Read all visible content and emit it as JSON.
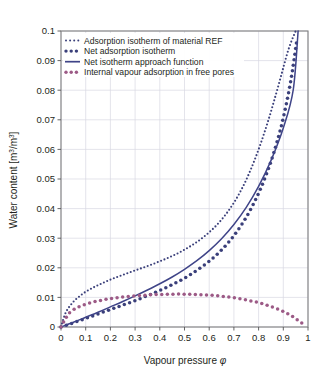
{
  "figure": {
    "background": "#ffffff",
    "frame_color": "#808080",
    "grid_color": "#d9d9e2"
  },
  "chart_data": {
    "type": "line",
    "title": "",
    "xlabel": "Vapour pressure φ",
    "ylabel": "Water content [m³/m³]",
    "ylabel_parts": {
      "pre": "Water content [m",
      "sup1": "3",
      "mid": "/m",
      "sup2": "3",
      "post": "]"
    },
    "xlim": [
      0,
      1
    ],
    "ylim": [
      0,
      0.1
    ],
    "xticks": [
      0,
      0.1,
      0.2,
      0.3,
      0.4,
      0.5,
      0.6,
      0.7,
      0.8,
      0.9,
      1
    ],
    "xtick_labels": [
      "0",
      "0.1",
      "0.2",
      "0.3",
      "0.4",
      "0.5",
      "0.6",
      "0.7",
      "0.8",
      "0.9",
      "1"
    ],
    "yticks": [
      0,
      0.01,
      0.02,
      0.03,
      0.04,
      0.05,
      0.06,
      0.07,
      0.08,
      0.09,
      0.1
    ],
    "ytick_labels": [
      "0",
      "0.01",
      "0.02",
      "0.03",
      "0.04",
      "0.05",
      "0.06",
      "0.07",
      "0.08",
      "0.09",
      "0.1"
    ],
    "grid": true,
    "legend_position": "top-left",
    "series": [
      {
        "name": "Adsorption isotherm of material REF",
        "style": "dotted",
        "marker": "small-dot",
        "color": "#3a3f7a",
        "x": [
          0.0,
          0.02,
          0.05,
          0.08,
          0.1,
          0.13,
          0.16,
          0.2,
          0.24,
          0.28,
          0.32,
          0.36,
          0.4,
          0.44,
          0.48,
          0.52,
          0.56,
          0.6,
          0.64,
          0.68,
          0.72,
          0.76,
          0.8,
          0.84,
          0.88,
          0.92,
          0.95
        ],
        "y": [
          0.0,
          0.005,
          0.0085,
          0.0107,
          0.0119,
          0.0133,
          0.0145,
          0.016,
          0.0173,
          0.0185,
          0.0197,
          0.0209,
          0.0222,
          0.0236,
          0.0252,
          0.0271,
          0.0293,
          0.032,
          0.0353,
          0.0395,
          0.0448,
          0.0516,
          0.06,
          0.07,
          0.0815,
          0.0935,
          0.1
        ]
      },
      {
        "name": "Net adsorption isotherm",
        "style": "dotted",
        "marker": "large-dot",
        "color": "#3a3f7a",
        "x": [
          0.0,
          0.03,
          0.06,
          0.09,
          0.12,
          0.15,
          0.18,
          0.21,
          0.24,
          0.27,
          0.3,
          0.33,
          0.36,
          0.39,
          0.42,
          0.45,
          0.48,
          0.51,
          0.54,
          0.57,
          0.6,
          0.63,
          0.66,
          0.69,
          0.72,
          0.75,
          0.78,
          0.81,
          0.84,
          0.87,
          0.9,
          0.93,
          0.955
        ],
        "y": [
          0.0,
          0.0008,
          0.0017,
          0.0026,
          0.0035,
          0.0044,
          0.0053,
          0.0062,
          0.0071,
          0.008,
          0.0089,
          0.0099,
          0.0109,
          0.012,
          0.0131,
          0.0143,
          0.0156,
          0.017,
          0.0186,
          0.0203,
          0.0222,
          0.0244,
          0.0269,
          0.0298,
          0.0332,
          0.0371,
          0.0417,
          0.0471,
          0.0535,
          0.0612,
          0.0707,
          0.083,
          0.097
        ]
      },
      {
        "name": "Net isotherm approach function",
        "style": "solid",
        "marker": "none",
        "color": "#3f4488",
        "x": [
          0.0,
          0.05,
          0.1,
          0.15,
          0.2,
          0.25,
          0.3,
          0.35,
          0.4,
          0.45,
          0.5,
          0.55,
          0.6,
          0.65,
          0.7,
          0.75,
          0.8,
          0.85,
          0.9,
          0.94,
          0.96
        ],
        "y": [
          0.0,
          0.0016,
          0.0033,
          0.005,
          0.0068,
          0.0086,
          0.0105,
          0.0125,
          0.0146,
          0.0169,
          0.0195,
          0.0224,
          0.0258,
          0.0298,
          0.0346,
          0.0404,
          0.0475,
          0.0562,
          0.0672,
          0.08,
          0.1
        ]
      },
      {
        "name": "Internal vapour adsorption in free pores",
        "style": "dotted",
        "marker": "large-dot",
        "color": "#9c5a86",
        "x": [
          0.0,
          0.03,
          0.06,
          0.09,
          0.12,
          0.15,
          0.18,
          0.21,
          0.25,
          0.29,
          0.33,
          0.37,
          0.41,
          0.45,
          0.49,
          0.53,
          0.57,
          0.61,
          0.65,
          0.69,
          0.73,
          0.77,
          0.81,
          0.85,
          0.89,
          0.93,
          0.96,
          0.99
        ],
        "y": [
          0.0,
          0.0044,
          0.0063,
          0.0074,
          0.0082,
          0.0088,
          0.0093,
          0.0097,
          0.0101,
          0.0104,
          0.0107,
          0.0109,
          0.011,
          0.0111,
          0.0111,
          0.011,
          0.0109,
          0.0107,
          0.0104,
          0.01,
          0.0095,
          0.0088,
          0.008,
          0.0069,
          0.0056,
          0.0039,
          0.0022,
          0.0004
        ]
      }
    ]
  },
  "legend": {
    "items": [
      {
        "label": "Adsorption isotherm of material REF",
        "marker": "small-dot",
        "color": "#3a3f7a"
      },
      {
        "label": "Net adsorption isotherm",
        "marker": "large-dot",
        "color": "#3a3f7a"
      },
      {
        "label": "Net isotherm approach function",
        "marker": "line",
        "color": "#3f4488"
      },
      {
        "label": "Internal vapour adsorption in free pores",
        "marker": "large-dot",
        "color": "#9c5a86"
      }
    ]
  }
}
